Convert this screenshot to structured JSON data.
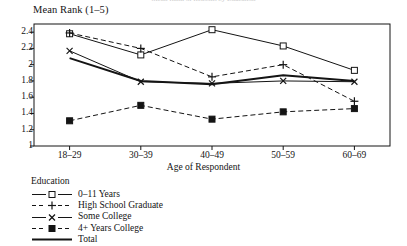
{
  "figure": {
    "cut_title": "Mean Rank of Reasons by Education",
    "ylabel": "Mean Rank (1–5)",
    "xlabel": "Age of Respondent",
    "legend_title": "Education",
    "axis_color": "#141414",
    "series_color": "#141414"
  },
  "chart_data": {
    "type": "line",
    "title": "",
    "xlabel": "Age of Respondent",
    "ylabel": "Mean Rank (1–5)",
    "categories": [
      "18–29",
      "30–39",
      "40–49",
      "50–59",
      "60–69"
    ],
    "ylim": [
      1,
      2.5
    ],
    "yticks": [
      1,
      1.2,
      1.4,
      1.6,
      1.8,
      2,
      2.2,
      2.4
    ],
    "ytick_labels": [
      "1",
      "1.2",
      "1.4",
      "1.6",
      "1.8",
      "2",
      "2.2",
      "2.4"
    ],
    "grid": false,
    "legend_position": "below-axes-left",
    "series": [
      {
        "name": "0–11 Years",
        "marker": "open-square",
        "linestyle": "solid",
        "linewidth": 1,
        "values": [
          2.38,
          2.12,
          2.43,
          2.23,
          1.93
        ]
      },
      {
        "name": "High School Graduate",
        "marker": "plus",
        "linestyle": "dashed",
        "linewidth": 1,
        "values": [
          2.39,
          2.2,
          1.85,
          2.0,
          1.55
        ]
      },
      {
        "name": "Some College",
        "marker": "x",
        "linestyle": "solid",
        "linewidth": 1,
        "values": [
          2.17,
          1.79,
          1.77,
          1.8,
          1.79
        ]
      },
      {
        "name": "4+ Years College",
        "marker": "filled-square",
        "linestyle": "dashed",
        "linewidth": 1,
        "values": [
          1.31,
          1.5,
          1.33,
          1.42,
          1.46
        ]
      },
      {
        "name": "Total",
        "marker": "none",
        "linestyle": "solid",
        "linewidth": 2,
        "values": [
          2.08,
          1.8,
          1.76,
          1.87,
          1.8
        ]
      }
    ]
  }
}
